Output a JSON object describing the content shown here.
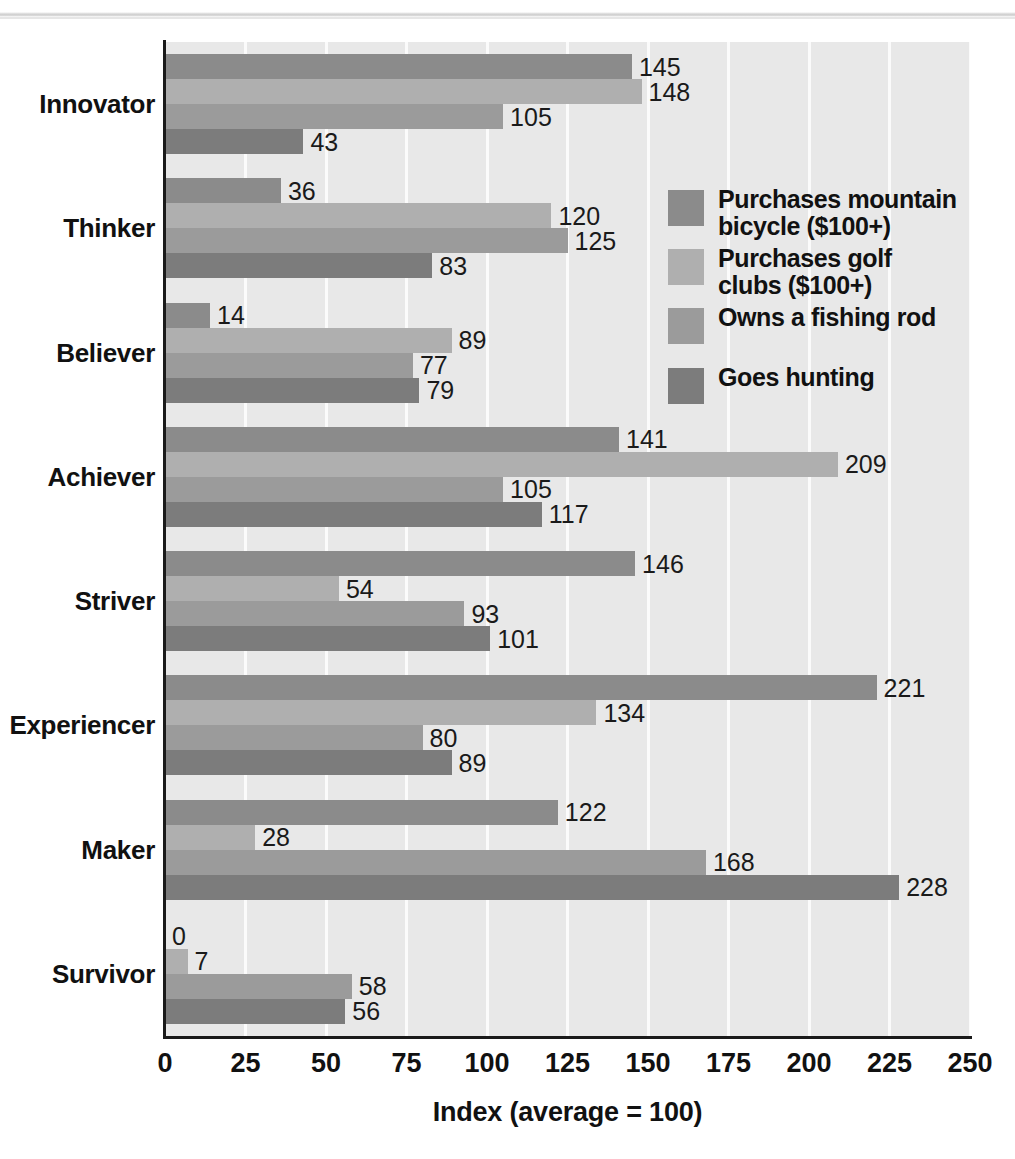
{
  "chart_data": {
    "type": "bar",
    "orientation": "horizontal",
    "title": "",
    "xlabel": "Index (average = 100)",
    "ylabel": "",
    "xlim": [
      0,
      250
    ],
    "xticks": [
      "0",
      "25",
      "50",
      "75",
      "100",
      "125",
      "150",
      "175",
      "200",
      "225",
      "250"
    ],
    "grid": true,
    "legend_position": "inside-right-upper",
    "categories": [
      "Innovator",
      "Thinker",
      "Believer",
      "Achiever",
      "Striver",
      "Experiencer",
      "Maker",
      "Survivor"
    ],
    "series": [
      {
        "name": "Purchases mountain bicycle ($100+)",
        "color": "#8b8b8b",
        "values": [
          145,
          36,
          14,
          141,
          146,
          221,
          122,
          0
        ]
      },
      {
        "name": "Purchases golf clubs ($100+)",
        "color": "#afafaf",
        "values": [
          148,
          120,
          89,
          209,
          54,
          134,
          28,
          7
        ]
      },
      {
        "name": "Owns a fishing rod",
        "color": "#9b9b9b",
        "values": [
          105,
          125,
          77,
          105,
          93,
          80,
          168,
          58
        ]
      },
      {
        "name": "Goes hunting",
        "color": "#7c7c7c",
        "values": [
          43,
          83,
          79,
          117,
          101,
          89,
          228,
          56
        ]
      }
    ]
  },
  "legend": {
    "items": [
      {
        "label_line1": "Purchases mountain",
        "label_line2": "bicycle ($100+)"
      },
      {
        "label_line1": "Purchases golf",
        "label_line2": "clubs ($100+)"
      },
      {
        "label_line1": "Owns a fishing rod",
        "label_line2": ""
      },
      {
        "label_line1": "Goes hunting",
        "label_line2": ""
      }
    ]
  },
  "colors": {
    "plot_background": "#e8e8e8",
    "gridline": "#fbfbfb",
    "axis": "#1a1a1a",
    "text": "#111111"
  }
}
